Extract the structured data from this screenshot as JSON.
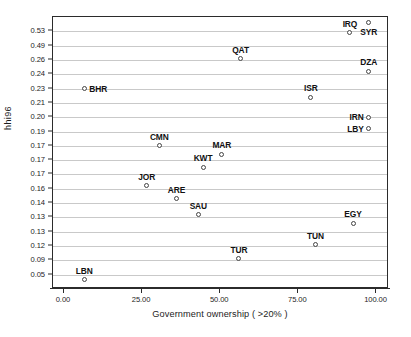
{
  "chart_data": {
    "type": "scatter",
    "title": "",
    "xlabel": "Government ownership ( >20% )",
    "ylabel": "hhi96",
    "xlim": [
      -3.5,
      104
    ],
    "ylim": [
      0,
      19
    ],
    "grid": true,
    "legend": "none",
    "xticks": [
      {
        "value": 0,
        "label": "0.00"
      },
      {
        "value": 25,
        "label": "25.00"
      },
      {
        "value": 50,
        "label": "50.00"
      },
      {
        "value": 75,
        "label": "75.00"
      },
      {
        "value": 100,
        "label": "100.00"
      }
    ],
    "yticks": [
      {
        "index": 18,
        "label": "0.53"
      },
      {
        "index": 17,
        "label": "0.49"
      },
      {
        "index": 16,
        "label": "0.26"
      },
      {
        "index": 15,
        "label": "0.24"
      },
      {
        "index": 14,
        "label": "0.23"
      },
      {
        "index": 13,
        "label": "0.21"
      },
      {
        "index": 12,
        "label": "0.20"
      },
      {
        "index": 11,
        "label": "0.19"
      },
      {
        "index": 10,
        "label": "0.17"
      },
      {
        "index": 9,
        "label": "0.17"
      },
      {
        "index": 8,
        "label": "0.17"
      },
      {
        "index": 7,
        "label": "0.16"
      },
      {
        "index": 6,
        "label": "0.14"
      },
      {
        "index": 5,
        "label": "0.13"
      },
      {
        "index": 4,
        "label": "0.13"
      },
      {
        "index": 3,
        "label": "0.12"
      },
      {
        "index": 2,
        "label": "0.09"
      },
      {
        "index": 1,
        "label": "0.05"
      }
    ],
    "points": [
      {
        "label": "SYR",
        "x": 97.5,
        "y_index": 18.6,
        "y_value": 0.53,
        "label_pos": "below"
      },
      {
        "label": "IRQ",
        "x": 91.5,
        "y_index": 17.9,
        "y_value": 0.49,
        "label_pos": "above"
      },
      {
        "label": "QAT",
        "x": 56.5,
        "y_index": 16.1,
        "y_value": 0.26,
        "label_pos": "above"
      },
      {
        "label": "DZA",
        "x": 97.5,
        "y_index": 15.2,
        "y_value": 0.24,
        "label_pos": "above"
      },
      {
        "label": "BHR",
        "x": 6.5,
        "y_index": 14.0,
        "y_value": 0.23,
        "label_pos": "right"
      },
      {
        "label": "ISR",
        "x": 79.0,
        "y_index": 13.4,
        "y_value": 0.21,
        "label_pos": "above"
      },
      {
        "label": "IRN",
        "x": 97.5,
        "y_index": 12.0,
        "y_value": 0.2,
        "label_pos": "left"
      },
      {
        "label": "LBY",
        "x": 97.5,
        "y_index": 11.2,
        "y_value": 0.19,
        "label_pos": "left"
      },
      {
        "label": "CMN",
        "x": 30.5,
        "y_index": 10.0,
        "y_value": 0.17,
        "label_pos": "above"
      },
      {
        "label": "MAR",
        "x": 50.5,
        "y_index": 9.4,
        "y_value": 0.17,
        "label_pos": "above"
      },
      {
        "label": "KWT",
        "x": 44.5,
        "y_index": 8.5,
        "y_value": 0.17,
        "label_pos": "above"
      },
      {
        "label": "JOR",
        "x": 26.5,
        "y_index": 7.2,
        "y_value": 0.16,
        "label_pos": "above"
      },
      {
        "label": "ARE",
        "x": 36.0,
        "y_index": 6.3,
        "y_value": 0.14,
        "label_pos": "above"
      },
      {
        "label": "SAU",
        "x": 43.0,
        "y_index": 5.2,
        "y_value": 0.13,
        "label_pos": "above"
      },
      {
        "label": "EGY",
        "x": 92.5,
        "y_index": 4.6,
        "y_value": 0.13,
        "label_pos": "above"
      },
      {
        "label": "TUN",
        "x": 80.5,
        "y_index": 3.1,
        "y_value": 0.12,
        "label_pos": "above"
      },
      {
        "label": "TUR",
        "x": 56.0,
        "y_index": 2.1,
        "y_value": 0.09,
        "label_pos": "above"
      },
      {
        "label": "LBN",
        "x": 6.5,
        "y_index": 0.65,
        "y_value": 0.05,
        "label_pos": "above"
      }
    ]
  }
}
